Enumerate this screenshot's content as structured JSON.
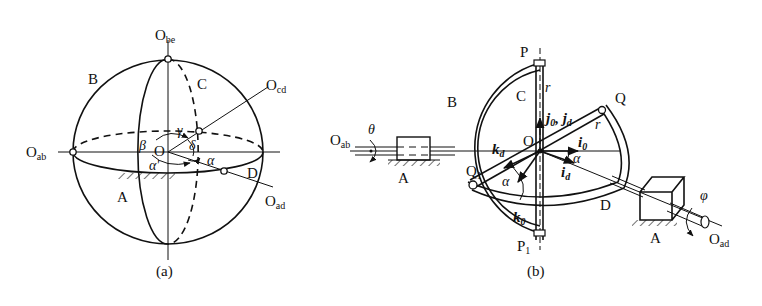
{
  "figure_a": {
    "caption": "(a)",
    "points": {
      "O_be": {
        "main": "O",
        "sub": "be"
      },
      "O_cd": {
        "main": "O",
        "sub": "cd"
      },
      "O_ab": {
        "main": "O",
        "sub": "ab"
      },
      "O_ad": {
        "main": "O",
        "sub": "ad"
      },
      "O": "O"
    },
    "bodies": {
      "A": "A",
      "B": "B",
      "C": "C",
      "D": "D"
    },
    "angles": {
      "alpha": "α",
      "alpha_prime": "α'",
      "beta": "β",
      "gamma": "γ",
      "delta": "δ"
    }
  },
  "figure_b": {
    "caption": "(b)",
    "points": {
      "O_ab": {
        "main": "O",
        "sub": "ab"
      },
      "O_ad": {
        "main": "O",
        "sub": "ad"
      },
      "O": "O",
      "P": "P",
      "P1": {
        "main": "P",
        "sub": "1"
      },
      "Q": "Q",
      "Q1": {
        "main": "Q",
        "sub": "1"
      }
    },
    "bodies": {
      "A_left": "A",
      "A_right": "A",
      "B": "B",
      "C": "C",
      "D": "D"
    },
    "angles": {
      "theta": "θ",
      "phi": "φ",
      "alpha1": "α",
      "alpha2": "α"
    },
    "vectors": {
      "r_top": "r",
      "r_q": "r",
      "j": {
        "a": "j",
        "a_sub": "0",
        "sep": ", ",
        "b": "j",
        "b_sub": "d"
      },
      "i0": {
        "main": "i",
        "sub": "0"
      },
      "id": {
        "main": "i",
        "sub": "d"
      },
      "kd": {
        "main": "k",
        "sub": "d"
      },
      "k0": {
        "main": "k",
        "sub": "0"
      }
    }
  }
}
